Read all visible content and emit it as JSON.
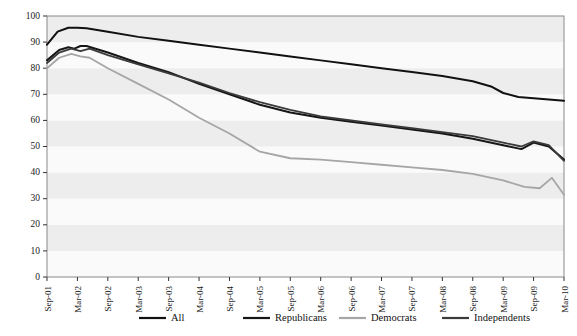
{
  "chart_data": {
    "type": "line",
    "title": "",
    "subtitle": "",
    "xlabel": "",
    "ylabel": "",
    "ylim": [
      0,
      100
    ],
    "ygrid": true,
    "grid_style": "alternating-horizontal-bands",
    "legend_position": "bottom",
    "yticks": [
      0,
      10,
      20,
      30,
      40,
      50,
      60,
      70,
      80,
      90,
      100
    ],
    "ytick_labels": [
      "0",
      "10",
      "20",
      "30",
      "40",
      "50",
      "60",
      "70",
      "80",
      "90",
      "100"
    ],
    "categories": [
      "Sep-01",
      "Mar-02",
      "Sep-02",
      "Mar-03",
      "Sep-03",
      "Mar-04",
      "Sep-04",
      "Mar-05",
      "Sep-05",
      "Mar-06",
      "Sep-06",
      "Mar-07",
      "Sep-07",
      "Mar-08",
      "Sep-08",
      "Mar-09",
      "Sep-09",
      "Mar-10"
    ],
    "xtick_labels": [
      "Sep-01",
      "Mar-02",
      "Sep-02",
      "Mar-03",
      "Sep-03",
      "Mar-04",
      "Sep-04",
      "Mar-05",
      "Sep-05",
      "Mar-06",
      "Sep-06",
      "Mar-07",
      "Sep-07",
      "Mar-08",
      "Sep-08",
      "Mar-09",
      "Sep-09",
      "Mar-10"
    ],
    "series": [
      {
        "name": "All",
        "color": "#111111",
        "width": 2.0,
        "x": [
          0,
          0.35,
          0.7,
          1.0,
          1.3,
          2.0,
          3.0,
          4.0,
          5.0,
          6.0,
          7.0,
          8.0,
          9.0,
          10.0,
          11.0,
          12.0,
          13.0,
          14.0,
          14.6,
          15.0,
          15.5,
          16.0,
          16.5,
          17.0
        ],
        "values": [
          89,
          94,
          95.5,
          95.5,
          95.3,
          94,
          92,
          90.5,
          89,
          87.5,
          86,
          84.5,
          83,
          81.5,
          80,
          78.5,
          77,
          75,
          73,
          70.5,
          69,
          68.5,
          68,
          67.5
        ]
      },
      {
        "name": "Republicans",
        "color": "#161616",
        "width": 2.0,
        "x": [
          0,
          0.4,
          0.7,
          0.9,
          1.1,
          1.3,
          2.0,
          3.0,
          4.0,
          5.0,
          6.0,
          7.0,
          8.0,
          9.0,
          10.0,
          11.0,
          12.0,
          13.0,
          14.0,
          15.0,
          15.6,
          16.0,
          16.5,
          17.0
        ],
        "values": [
          83,
          87,
          88,
          87.5,
          88.5,
          88.5,
          86,
          82,
          78.5,
          74,
          70,
          66,
          63,
          61,
          59.5,
          58,
          56.5,
          55,
          53,
          50.5,
          49,
          51.5,
          50,
          45
        ]
      },
      {
        "name": "Democrats",
        "color": "#a6a6a6",
        "width": 1.8,
        "x": [
          0,
          0.4,
          0.8,
          1.1,
          1.4,
          2.0,
          3.0,
          4.0,
          5.0,
          6.0,
          7.0,
          8.0,
          9.0,
          10.0,
          11.0,
          12.0,
          13.0,
          14.0,
          15.0,
          15.7,
          16.2,
          16.6,
          17.0
        ],
        "values": [
          80,
          84,
          85.5,
          84.5,
          84,
          80,
          74,
          68,
          61,
          55,
          48,
          45.5,
          45,
          44,
          43,
          42,
          41,
          39.5,
          37,
          34.5,
          34,
          38,
          31.5
        ]
      },
      {
        "name": "Independents",
        "color": "#3a3a3a",
        "width": 1.8,
        "x": [
          0,
          0.4,
          0.8,
          1.1,
          1.4,
          2.0,
          3.0,
          4.0,
          5.0,
          6.0,
          7.0,
          8.0,
          9.0,
          10.0,
          11.0,
          12.0,
          13.0,
          14.0,
          15.0,
          15.6,
          16.0,
          16.5,
          17.0
        ],
        "values": [
          82,
          86,
          87.5,
          86.5,
          87.5,
          85,
          81.5,
          78,
          74.5,
          70.5,
          67,
          64,
          61.5,
          60,
          58.5,
          57,
          55.5,
          54,
          51.5,
          50,
          52,
          50.5,
          44.5
        ]
      }
    ],
    "legend": [
      {
        "label": "All",
        "color": "#111111"
      },
      {
        "label": "Republicans",
        "color": "#161616"
      },
      {
        "label": "Democrats",
        "color": "#a6a6a6"
      },
      {
        "label": "Independents",
        "color": "#3a3a3a"
      }
    ]
  },
  "top_clipped_text": "",
  "colors": {
    "plot_background": "#fbfbfb",
    "band_light": "#fafafa",
    "band_dark": "#ededed",
    "axis": "#555555",
    "frame": "#8a8a8a"
  }
}
